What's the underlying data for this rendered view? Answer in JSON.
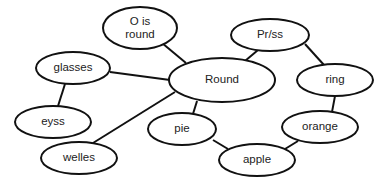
{
  "diagram": {
    "type": "concept-map",
    "colors": {
      "stroke": "#111111",
      "fill": "#ffffff",
      "text": "#222222"
    },
    "nodes": [
      {
        "id": "o_is_round",
        "lines": [
          "O is",
          "round"
        ],
        "cx": 140,
        "cy": 28,
        "rx": 37,
        "ry": 21
      },
      {
        "id": "glasses",
        "lines": [
          "glasses"
        ],
        "cx": 73,
        "cy": 68,
        "rx": 37,
        "ry": 16
      },
      {
        "id": "eyss",
        "lines": [
          "eyss"
        ],
        "cx": 53,
        "cy": 122,
        "rx": 38,
        "ry": 16
      },
      {
        "id": "welles",
        "lines": [
          "welles"
        ],
        "cx": 79,
        "cy": 158,
        "rx": 38,
        "ry": 16
      },
      {
        "id": "round",
        "lines": [
          "Round"
        ],
        "cx": 222,
        "cy": 80,
        "rx": 53,
        "ry": 22
      },
      {
        "id": "pie",
        "lines": [
          "pie"
        ],
        "cx": 182,
        "cy": 129,
        "rx": 34,
        "ry": 16
      },
      {
        "id": "prss",
        "lines": [
          "Pr/ss"
        ],
        "cx": 270,
        "cy": 35,
        "rx": 39,
        "ry": 16
      },
      {
        "id": "ring",
        "lines": [
          "ring"
        ],
        "cx": 335,
        "cy": 80,
        "rx": 38,
        "ry": 16
      },
      {
        "id": "orange",
        "lines": [
          "orange"
        ],
        "cx": 320,
        "cy": 127,
        "rx": 38,
        "ry": 16
      },
      {
        "id": "apple",
        "lines": [
          "apple"
        ],
        "cx": 257,
        "cy": 160,
        "rx": 38,
        "ry": 16
      }
    ],
    "edges": [
      {
        "from": "o_is_round",
        "to": "round",
        "x1": 162,
        "y1": 43,
        "x2": 186,
        "y2": 63
      },
      {
        "from": "glasses",
        "to": "round",
        "x1": 110,
        "y1": 72,
        "x2": 170,
        "y2": 80
      },
      {
        "from": "glasses",
        "to": "eyss",
        "x1": 65,
        "y1": 84,
        "x2": 58,
        "y2": 106
      },
      {
        "from": "welles",
        "to": "round",
        "x1": 93,
        "y1": 143,
        "x2": 175,
        "y2": 92
      },
      {
        "from": "round",
        "to": "pie",
        "x1": 197,
        "y1": 101,
        "x2": 193,
        "y2": 114
      },
      {
        "from": "round",
        "to": "prss",
        "x1": 245,
        "y1": 61,
        "x2": 258,
        "y2": 50
      },
      {
        "from": "prss",
        "to": "ring",
        "x1": 305,
        "y1": 44,
        "x2": 324,
        "y2": 65
      },
      {
        "from": "ring",
        "to": "orange",
        "x1": 335,
        "y1": 96,
        "x2": 332,
        "y2": 112
      },
      {
        "from": "pie",
        "to": "apple",
        "x1": 213,
        "y1": 140,
        "x2": 228,
        "y2": 149
      },
      {
        "from": "orange",
        "to": "apple",
        "x1": 298,
        "y1": 141,
        "x2": 285,
        "y2": 149
      }
    ]
  }
}
